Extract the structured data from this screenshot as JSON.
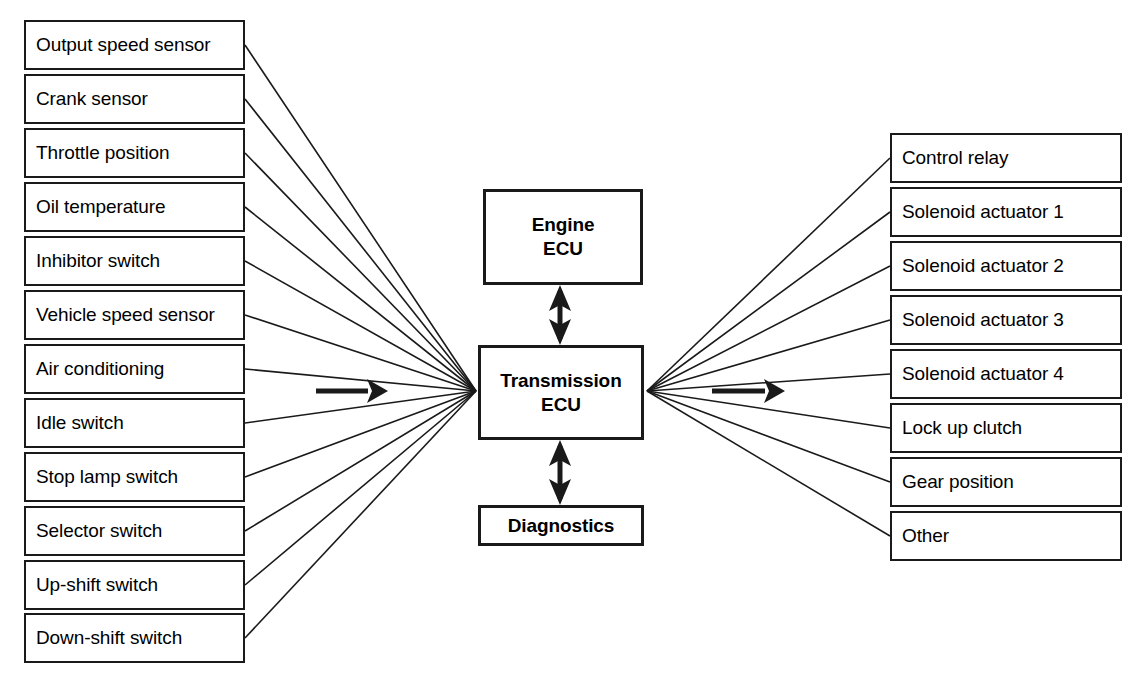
{
  "diagram": {
    "canvas": {
      "width": 1136,
      "height": 678,
      "background": "#ffffff"
    },
    "stroke_color": "#1a1a1a",
    "inputs": {
      "group_label": "inputs",
      "items": [
        {
          "label": "Output speed sensor",
          "x": 24,
          "y": 20,
          "w": 221,
          "h": 50
        },
        {
          "label": "Crank sensor",
          "x": 24,
          "y": 74,
          "w": 221,
          "h": 50
        },
        {
          "label": "Throttle position",
          "x": 24,
          "y": 128,
          "w": 221,
          "h": 50
        },
        {
          "label": "Oil temperature",
          "x": 24,
          "y": 182,
          "w": 221,
          "h": 50
        },
        {
          "label": "Inhibitor switch",
          "x": 24,
          "y": 236,
          "w": 221,
          "h": 50
        },
        {
          "label": "Vehicle speed sensor",
          "x": 24,
          "y": 290,
          "w": 221,
          "h": 50
        },
        {
          "label": "Air conditioning",
          "x": 24,
          "y": 344,
          "w": 221,
          "h": 50
        },
        {
          "label": "Idle switch",
          "x": 24,
          "y": 398,
          "w": 221,
          "h": 50
        },
        {
          "label": "Stop lamp switch",
          "x": 24,
          "y": 452,
          "w": 221,
          "h": 50
        },
        {
          "label": "Selector switch",
          "x": 24,
          "y": 506,
          "w": 221,
          "h": 50
        },
        {
          "label": "Up-shift switch",
          "x": 24,
          "y": 560,
          "w": 221,
          "h": 50
        },
        {
          "label": "Down-shift switch",
          "x": 24,
          "y": 613,
          "w": 221,
          "h": 50
        }
      ]
    },
    "outputs": {
      "group_label": "outputs",
      "items": [
        {
          "label": "Control relay",
          "x": 890,
          "y": 133,
          "w": 232,
          "h": 50
        },
        {
          "label": "Solenoid actuator 1",
          "x": 890,
          "y": 187,
          "w": 232,
          "h": 50
        },
        {
          "label": "Solenoid actuator 2",
          "x": 890,
          "y": 241,
          "w": 232,
          "h": 50
        },
        {
          "label": "Solenoid actuator 3",
          "x": 890,
          "y": 295,
          "w": 232,
          "h": 50
        },
        {
          "label": "Solenoid actuator 4",
          "x": 890,
          "y": 349,
          "w": 232,
          "h": 50
        },
        {
          "label": "Lock up clutch",
          "x": 890,
          "y": 403,
          "w": 232,
          "h": 50
        },
        {
          "label": "Gear position",
          "x": 890,
          "y": 457,
          "w": 232,
          "h": 50
        },
        {
          "label": "Other",
          "x": 890,
          "y": 511,
          "w": 232,
          "h": 50
        }
      ]
    },
    "center_nodes": [
      {
        "id": "engine-ecu",
        "label": "Engine\nECU",
        "x": 483,
        "y": 189,
        "w": 160,
        "h": 96
      },
      {
        "id": "transmission-ecu",
        "label": "Transmission\nECU",
        "x": 478,
        "y": 345,
        "w": 166,
        "h": 95
      },
      {
        "id": "diagnostics",
        "label": "Diagnostics",
        "x": 478,
        "y": 505,
        "w": 166,
        "h": 41
      }
    ],
    "hubs": {
      "left": {
        "x": 476,
        "y": 391
      },
      "right": {
        "x": 647,
        "y": 391
      }
    },
    "flow_arrows": [
      {
        "id": "input-flow-arrow",
        "x1": 316,
        "y1": 391,
        "x2": 388,
        "y2": 391,
        "direction": "right"
      },
      {
        "id": "output-flow-arrow",
        "x1": 712,
        "y1": 391,
        "x2": 785,
        "y2": 391,
        "direction": "right"
      }
    ],
    "bidirectional_links": [
      {
        "id": "engine-ecu-link",
        "x": 560,
        "y1": 285,
        "y2": 345
      },
      {
        "id": "diagnostics-link",
        "x": 560,
        "y1": 440,
        "y2": 505
      }
    ]
  }
}
